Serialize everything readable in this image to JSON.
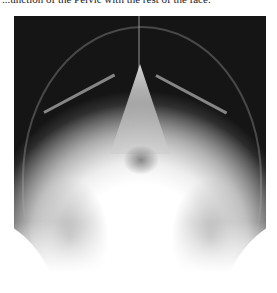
{
  "caption": {
    "text": "...unction of the Pelvic with the rest of the face."
  },
  "figure": {
    "alt": "X-ray of skull"
  }
}
